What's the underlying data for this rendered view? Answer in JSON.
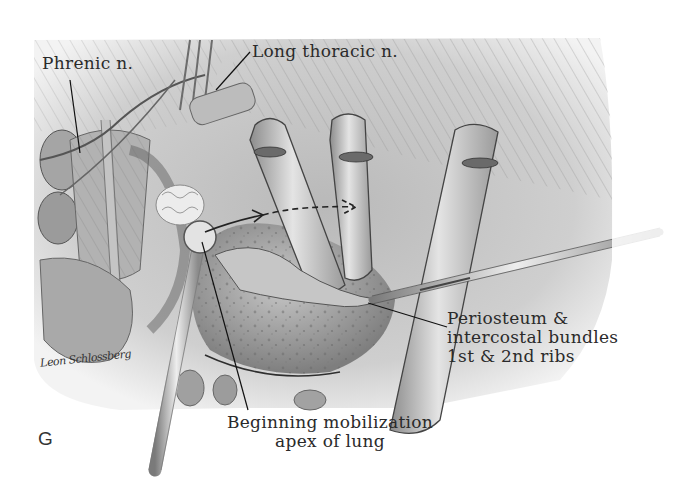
{
  "figure": {
    "plate_letter": "G",
    "signature": "Leon Schlossberg",
    "labels": {
      "phrenic": "Phrenic n.",
      "long_thoracic": "Long thoracic n.",
      "periosteum": [
        "Periosteum &",
        "intercostal bundles",
        "1st & 2nd ribs"
      ],
      "mobilization": [
        "Beginning mobilization",
        "apex of lung"
      ]
    },
    "colors": {
      "background": "#ffffff",
      "ink": "#2a2a2a",
      "tissue_light": "#d9d9d9",
      "tissue_mid": "#a8a8a8",
      "tissue_dark": "#6e6e6e"
    }
  }
}
